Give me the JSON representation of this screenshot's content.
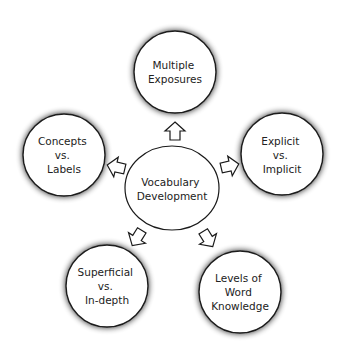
{
  "diagram": {
    "center": {
      "lines": [
        "Vocabulary",
        "Development"
      ]
    },
    "nodes": [
      {
        "id": "multiple-exposures",
        "lines": [
          "Multiple",
          "Exposures"
        ],
        "position": "top"
      },
      {
        "id": "explicit-vs-implicit",
        "lines": [
          "Explicit",
          "vs.",
          "Implicit"
        ],
        "position": "right"
      },
      {
        "id": "levels-of-word-knowledge",
        "lines": [
          "Levels of",
          "Word",
          "Knowledge"
        ],
        "position": "bottom-right"
      },
      {
        "id": "superficial-vs-in-depth",
        "lines": [
          "Superficial",
          "vs.",
          "In-depth"
        ],
        "position": "bottom-left"
      },
      {
        "id": "concepts-vs-labels",
        "lines": [
          "Concepts",
          "vs.",
          "Labels"
        ],
        "position": "left"
      }
    ],
    "arrows": [
      {
        "from": "center",
        "to": "multiple-exposures"
      },
      {
        "from": "center",
        "to": "explicit-vs-implicit"
      },
      {
        "from": "center",
        "to": "levels-of-word-knowledge"
      },
      {
        "from": "center",
        "to": "superficial-vs-in-depth"
      },
      {
        "from": "center",
        "to": "concepts-vs-labels"
      }
    ],
    "colors": {
      "background": "#ffffff",
      "stroke": "#1a1a1a",
      "fill": "#ffffff",
      "shadow": "#000000",
      "text": "#222222"
    }
  }
}
